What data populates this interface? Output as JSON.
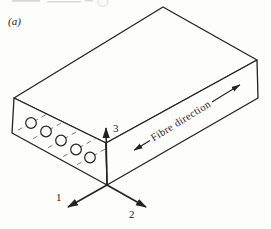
{
  "figure": {
    "panel_label": "(a)",
    "annotation": {
      "fibre_direction_label": "Fibre direction"
    },
    "axis_labels": {
      "one": "1",
      "two": "2",
      "three": "3"
    },
    "fibre_cross_sections_count": 5,
    "colors": {
      "ink": "#222222",
      "paper": "#fdfdfb",
      "dash": "#7a7a7a",
      "remnant": "#d9d9d6"
    }
  }
}
